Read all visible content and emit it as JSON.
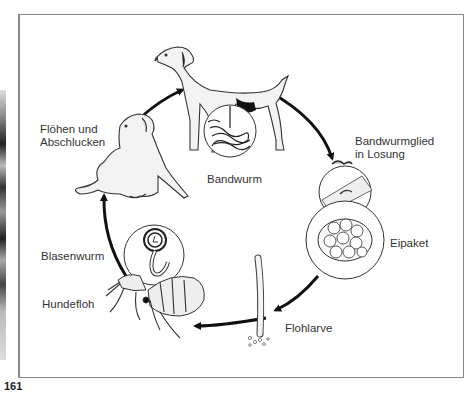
{
  "figure": {
    "number": "161"
  },
  "labels": {
    "floehen": "Flöhen und",
    "abschlucken": "Abschlucken",
    "bandwurm": "Bandwurm",
    "bandwurmglied": "Bandwurmglied",
    "in_losung": "in Losung",
    "eipaket": "Eipaket",
    "flohlarve": "Flohlarve",
    "hundefloh": "Hundefloh",
    "blasenwurm": "Blasenwurm"
  },
  "cycle": [
    "Flöhen und Abschlucken",
    "Bandwurm",
    "Bandwurmglied in Losung",
    "Eipaket",
    "Flohlarve",
    "Hundefloh",
    "Blasenwurm"
  ]
}
